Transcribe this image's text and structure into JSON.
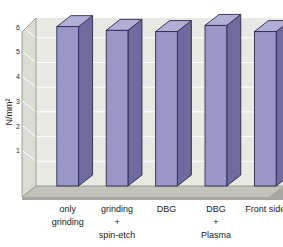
{
  "chart_data": {
    "type": "bar",
    "title": "",
    "subtitle": "",
    "xlabel": "",
    "ylabel": "N/mm²",
    "categories": [
      "only grinding",
      "grinding + spin-etch",
      "DBG",
      "DBG + Plasma",
      "Front side"
    ],
    "category_lines": [
      [
        "only",
        "grinding"
      ],
      [
        "grinding",
        "+",
        "spin-etch"
      ],
      [
        "DBG"
      ],
      [
        "DBG",
        "+",
        "Plasma"
      ],
      [
        "Front side"
      ]
    ],
    "values": [
      6.45,
      6.3,
      6.25,
      6.5,
      6.25
    ],
    "ylim": [
      0,
      6.8
    ],
    "yticks": [
      1,
      2,
      3,
      4,
      5,
      6
    ],
    "ytick_labels": [
      "1",
      "2",
      "3",
      "4",
      "5",
      "6"
    ],
    "grid": true,
    "legend": false,
    "legend_position": "none",
    "style": "3d-column",
    "colors": {
      "bar_front": "#9b95c9",
      "bar_side": "#6f6aa0",
      "bar_top": "#b3aed6",
      "bar_outline": "#2b2b4a",
      "plot_background": "#e9e9e4",
      "wall_side": "#dcdcd6",
      "floor": "#a8a8a0",
      "floor_top": "#c3c3bc",
      "gridline": "#ffffff",
      "axis_line": "#8a8a84",
      "text": "#1a1a1a"
    }
  }
}
